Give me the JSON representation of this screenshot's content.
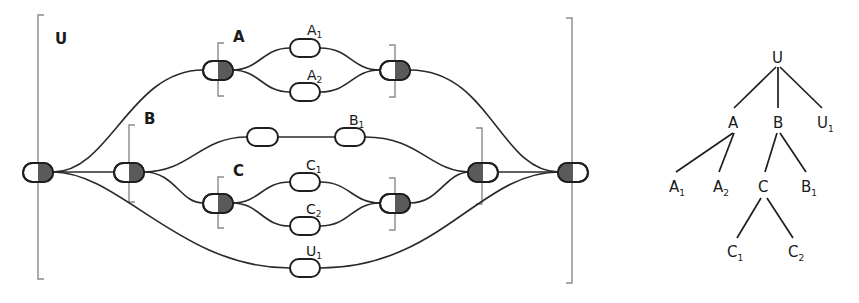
{
  "left_diagram": {
    "groups": {
      "U": {
        "label": "U"
      },
      "A": {
        "label": "A"
      },
      "B": {
        "label": "B"
      },
      "C": {
        "label": "C"
      }
    },
    "leaves": {
      "A1": {
        "base": "A",
        "sub": "1"
      },
      "A2": {
        "base": "A",
        "sub": "2"
      },
      "B1": {
        "base": "B",
        "sub": "1"
      },
      "C1": {
        "base": "C",
        "sub": "1"
      },
      "C2": {
        "base": "C",
        "sub": "2"
      },
      "U1": {
        "base": "U",
        "sub": "1"
      }
    },
    "colors": {
      "wire": "#2a2a2a",
      "bracket": "#8a8a8a",
      "node_fill": "#5a5a5a"
    }
  },
  "tree": {
    "nodes": {
      "U": {
        "base": "U",
        "sub": ""
      },
      "A": {
        "base": "A",
        "sub": ""
      },
      "B": {
        "base": "B",
        "sub": ""
      },
      "U1": {
        "base": "U",
        "sub": "1"
      },
      "A1": {
        "base": "A",
        "sub": "1"
      },
      "A2": {
        "base": "A",
        "sub": "2"
      },
      "C": {
        "base": "C",
        "sub": ""
      },
      "B1": {
        "base": "B",
        "sub": "1"
      },
      "C1": {
        "base": "C",
        "sub": "1"
      },
      "C2": {
        "base": "C",
        "sub": "2"
      }
    },
    "edges": [
      [
        "U",
        "A"
      ],
      [
        "U",
        "B"
      ],
      [
        "U",
        "U1"
      ],
      [
        "A",
        "A1"
      ],
      [
        "A",
        "A2"
      ],
      [
        "B",
        "C"
      ],
      [
        "B",
        "B1"
      ],
      [
        "C",
        "C1"
      ],
      [
        "C",
        "C2"
      ]
    ]
  }
}
